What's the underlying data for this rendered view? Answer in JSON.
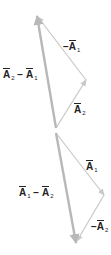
{
  "diagram": {
    "colors": {
      "thin_vector": "#c8c8c8",
      "thick_vector": "#b8b8b8",
      "text": "#222222",
      "background": "#ffffff"
    },
    "top_triangle": {
      "labels": {
        "neg_a1": {
          "prefix": "−",
          "base": "A",
          "sub": "1"
        },
        "a2": {
          "prefix": "",
          "base": "A",
          "sub": "2"
        },
        "diff": {
          "left_base": "A",
          "left_sub": "2",
          "op": "−",
          "right_base": "A",
          "right_sub": "1"
        }
      }
    },
    "bottom_triangle": {
      "labels": {
        "a1": {
          "prefix": "",
          "base": "A",
          "sub": "1"
        },
        "neg_a2": {
          "prefix": "−",
          "base": "A",
          "sub": "2"
        },
        "diff": {
          "left_base": "A",
          "left_sub": "1",
          "op": "−",
          "right_base": "A",
          "right_sub": "2"
        }
      }
    }
  }
}
